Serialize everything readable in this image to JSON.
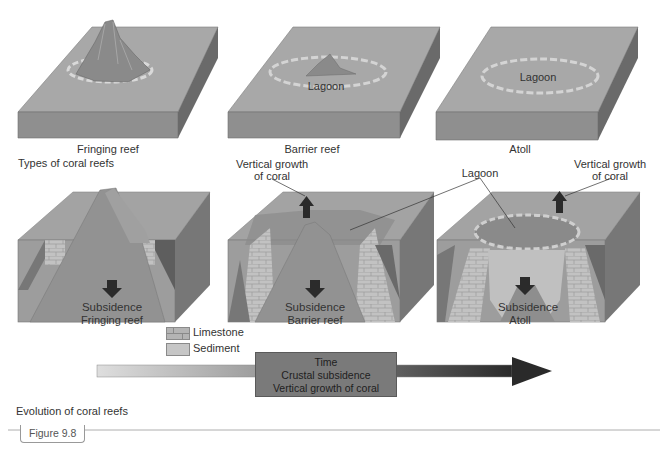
{
  "figure": {
    "number_label": "Figure 9.8",
    "caption_top": "Types of coral reefs",
    "caption_bottom": "Evolution of coral reefs"
  },
  "top_row": [
    {
      "label": "Fringing reef",
      "inner_label": ""
    },
    {
      "label": "Barrier reef",
      "inner_label": "Lagoon"
    },
    {
      "label": "Atoll",
      "inner_label": "Lagoon"
    }
  ],
  "bottom_row": [
    {
      "label": "Fringing reef",
      "subsidence_label": "Subsidence"
    },
    {
      "label": "Barrier reef",
      "subsidence_label": "Subsidence"
    },
    {
      "label": "Atoll",
      "subsidence_label": "Subsidence"
    }
  ],
  "annotations": {
    "vertical_growth_left": [
      "Vertical growth",
      "of coral"
    ],
    "vertical_growth_right": [
      "Vertical growth",
      "of coral"
    ],
    "lagoon": "Lagoon"
  },
  "legend": [
    {
      "label": "Limestone",
      "color": "#b4b4b4"
    },
    {
      "label": "Sediment",
      "color": "#c6c6c6"
    }
  ],
  "timeline": {
    "lines": [
      "Time",
      "Crustal subsidence",
      "Vertical growth of coral"
    ]
  },
  "colors": {
    "ocean_top": "#a9a9a9",
    "ocean_side": "#8d8d8d",
    "ocean_right": "#6e6e6e",
    "mountain": "#8c8c8c",
    "limestone": "#bdbdbd",
    "arrow_dark": "#2b2b2b"
  }
}
